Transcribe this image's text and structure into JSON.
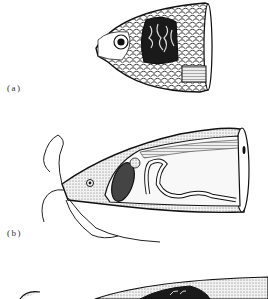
{
  "figure": {
    "panels": [
      {
        "id": "a",
        "label": "(a)",
        "subject": "fish head with gill cover cut away showing gills"
      },
      {
        "id": "b",
        "label": "(b)",
        "subject": "barbeled fish head, sectioned, showing internal organs"
      },
      {
        "id": "c",
        "label": "",
        "subject": "partial view of third fish head (cropped)"
      }
    ]
  }
}
